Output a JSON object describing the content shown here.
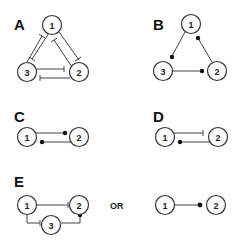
{
  "panels": {
    "A": {
      "label": "A",
      "nodes": [
        "1",
        "2",
        "3"
      ],
      "edges": [
        {
          "from": "1",
          "to": "2",
          "type": "inhibit"
        },
        {
          "from": "2",
          "to": "1",
          "type": "inhibit"
        },
        {
          "from": "1",
          "to": "3",
          "type": "inhibit"
        },
        {
          "from": "3",
          "to": "1",
          "type": "inhibit"
        },
        {
          "from": "3",
          "to": "2",
          "type": "inhibit"
        },
        {
          "from": "2",
          "to": "3",
          "type": "inhibit"
        }
      ]
    },
    "B": {
      "label": "B",
      "nodes": [
        "1",
        "2",
        "3"
      ],
      "edges": [
        {
          "from": "1",
          "to": "3",
          "type": "dot"
        },
        {
          "from": "2",
          "to": "1",
          "type": "dot"
        },
        {
          "from": "3",
          "to": "2",
          "type": "dot"
        }
      ]
    },
    "C": {
      "label": "C",
      "nodes": [
        "1",
        "2"
      ],
      "edges": [
        {
          "from": "1",
          "to": "2",
          "type": "dot"
        },
        {
          "from": "2",
          "to": "1",
          "type": "dot"
        }
      ]
    },
    "D": {
      "label": "D",
      "nodes": [
        "1",
        "2"
      ],
      "edges": [
        {
          "from": "1",
          "to": "2",
          "type": "inhibit"
        },
        {
          "from": "2",
          "to": "1",
          "type": "dot"
        }
      ]
    },
    "E": {
      "label": "E",
      "or_label": "OR",
      "left": {
        "nodes": [
          "1",
          "2",
          "3"
        ],
        "edges": [
          {
            "from": "1",
            "to": "2",
            "type": "inhibit"
          },
          {
            "from": "1",
            "to": "3",
            "type": "inhibit"
          },
          {
            "from": "3",
            "to": "2",
            "type": "dot"
          }
        ]
      },
      "right": {
        "nodes": [
          "1",
          "2"
        ],
        "edges": [
          {
            "from": "1",
            "to": "2",
            "type": "dot"
          }
        ]
      }
    }
  }
}
